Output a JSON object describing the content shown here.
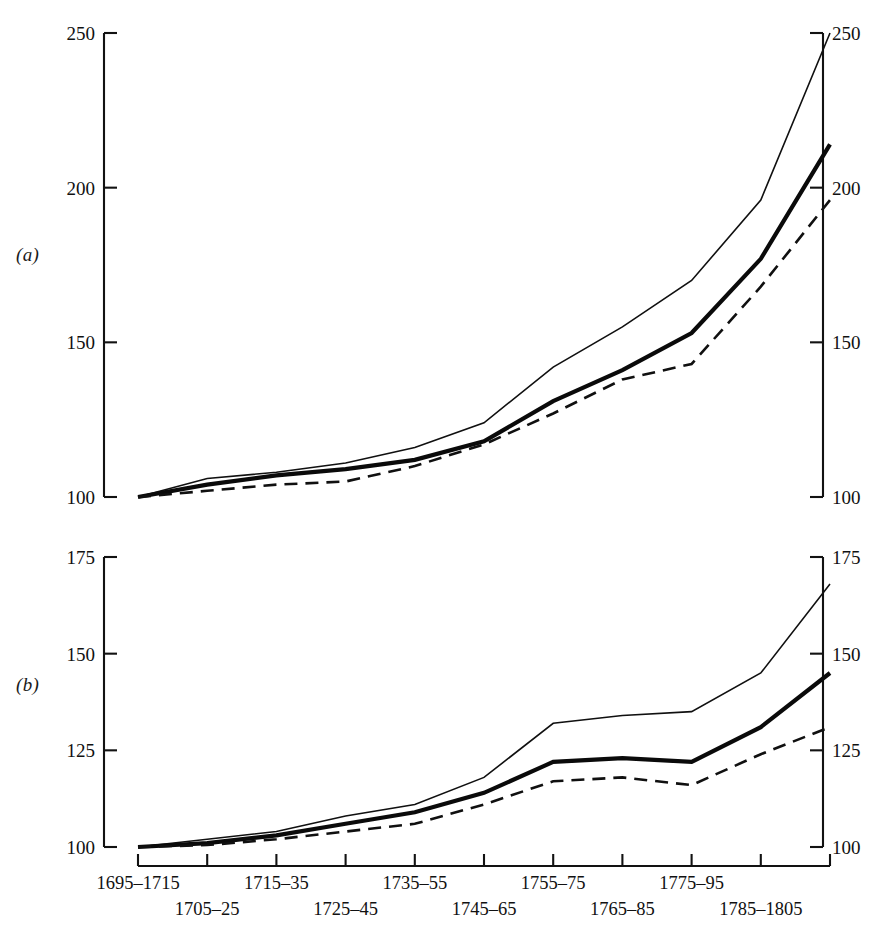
{
  "figure": {
    "panel_a_label": "(a)",
    "panel_b_label": "(b)"
  },
  "axis": {
    "x_labels_top": [
      "1695–1715",
      "1715–35",
      "1735–55",
      "1755–75",
      "1775–95"
    ],
    "x_labels_bottom": [
      "1705–25",
      "1725–45",
      "1745–65",
      "1765–85",
      "1785–1805"
    ],
    "a_yticks": [
      "100",
      "150",
      "200",
      "250"
    ],
    "b_yticks": [
      "100",
      "125",
      "150",
      "175"
    ]
  },
  "chart_data": [
    {
      "type": "line",
      "panel": "(a)",
      "title": "",
      "xlabel": "",
      "ylabel": "",
      "grid": false,
      "legend": "none",
      "ylim": [
        100,
        250
      ],
      "yticks": [
        100,
        150,
        200,
        250
      ],
      "categories": [
        "1695–1715",
        "1705–25",
        "1715–35",
        "1725–45",
        "1735–55",
        "1745–65",
        "1755–75",
        "1765–85",
        "1775–95",
        "1785–1805"
      ],
      "series": [
        {
          "name": "thin-solid",
          "style": "solid-thin",
          "values": [
            100,
            106,
            108,
            111,
            116,
            124,
            142,
            155,
            170,
            196,
            250
          ]
        },
        {
          "name": "thick-solid",
          "style": "solid-thick",
          "values": [
            100,
            104,
            107,
            109,
            112,
            118,
            131,
            141,
            153,
            177,
            214
          ]
        },
        {
          "name": "dashed",
          "style": "dashed",
          "values": [
            100,
            102,
            104,
            105,
            110,
            117,
            127,
            138,
            143,
            168,
            196
          ]
        }
      ]
    },
    {
      "type": "line",
      "panel": "(b)",
      "title": "",
      "xlabel": "",
      "ylabel": "",
      "grid": false,
      "legend": "none",
      "ylim": [
        100,
        175
      ],
      "yticks": [
        100,
        125,
        150,
        175
      ],
      "categories": [
        "1695–1715",
        "1705–25",
        "1715–35",
        "1725–45",
        "1735–55",
        "1745–65",
        "1755–75",
        "1765–85",
        "1775–95",
        "1785–1805"
      ],
      "series": [
        {
          "name": "thin-solid",
          "style": "solid-thin",
          "values": [
            100,
            102,
            104,
            108,
            111,
            118,
            132,
            134,
            135,
            145,
            168
          ]
        },
        {
          "name": "thick-solid",
          "style": "solid-thick",
          "values": [
            100,
            101,
            103,
            106,
            109,
            114,
            122,
            123,
            122,
            131,
            145
          ]
        },
        {
          "name": "dashed",
          "style": "dashed",
          "values": [
            100,
            100.5,
            102,
            104,
            106,
            111,
            117,
            118,
            116,
            124,
            131
          ]
        }
      ]
    }
  ]
}
